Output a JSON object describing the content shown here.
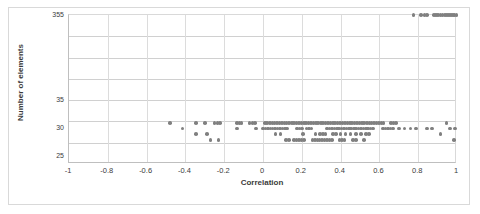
{
  "chart_data": {
    "type": "scatter",
    "title": "",
    "xlabel": "Correlation",
    "ylabel": "Number of elements",
    "xlim": [
      -1,
      1
    ],
    "xticks": [
      -1,
      -0.8,
      -0.6,
      -0.4,
      -0.2,
      0,
      0.2,
      0.4,
      0.6,
      0.8,
      1
    ],
    "xticklabels": [
      "-1",
      "-0.8",
      "-0.6",
      "-0.4",
      "-0.2",
      "0",
      "0.2",
      "0.4",
      "0.6",
      "0.8",
      "1"
    ],
    "yticklabels": [
      "355",
      "35",
      "30",
      "25"
    ],
    "ytick_positions_frac": [
      0.0,
      0.571,
      0.762,
      0.952
    ],
    "grid": true,
    "grid_rows": 7,
    "marker_color": "#808080",
    "marker_shape": "circle",
    "axis_note": "y-axis is irregular/broken: 25, 30, 35 then jumps to 355",
    "series": [
      {
        "name": "elements",
        "points": [
          [
            0.775,
            355
          ],
          [
            0.815,
            355
          ],
          [
            0.833,
            355
          ],
          [
            0.846,
            355
          ],
          [
            0.88,
            355
          ],
          [
            0.892,
            355
          ],
          [
            0.903,
            355
          ],
          [
            0.915,
            355
          ],
          [
            0.926,
            355
          ],
          [
            0.937,
            355
          ],
          [
            0.948,
            355
          ],
          [
            0.958,
            355
          ],
          [
            0.968,
            355
          ],
          [
            0.978,
            355
          ],
          [
            0.988,
            355
          ],
          [
            0.997,
            355
          ],
          [
            -0.48,
            31
          ],
          [
            -0.345,
            31
          ],
          [
            -0.3,
            31
          ],
          [
            -0.25,
            31
          ],
          [
            -0.235,
            31
          ],
          [
            -0.222,
            31
          ],
          [
            -0.135,
            31
          ],
          [
            -0.122,
            31
          ],
          [
            -0.11,
            31
          ],
          [
            -0.07,
            31
          ],
          [
            -0.055,
            31
          ],
          [
            -0.042,
            31
          ],
          [
            0.01,
            31
          ],
          [
            0.022,
            31
          ],
          [
            0.035,
            31
          ],
          [
            0.048,
            31
          ],
          [
            0.06,
            31
          ],
          [
            0.072,
            31
          ],
          [
            0.085,
            31
          ],
          [
            0.098,
            31
          ],
          [
            0.11,
            31
          ],
          [
            0.122,
            31
          ],
          [
            0.135,
            31
          ],
          [
            0.148,
            31
          ],
          [
            0.16,
            31
          ],
          [
            0.172,
            31
          ],
          [
            0.185,
            31
          ],
          [
            0.198,
            31
          ],
          [
            0.21,
            31
          ],
          [
            0.222,
            31
          ],
          [
            0.235,
            31
          ],
          [
            0.248,
            31
          ],
          [
            0.26,
            31
          ],
          [
            0.272,
            31
          ],
          [
            0.285,
            31
          ],
          [
            0.298,
            31
          ],
          [
            0.31,
            31
          ],
          [
            0.322,
            31
          ],
          [
            0.335,
            31
          ],
          [
            0.348,
            31
          ],
          [
            0.36,
            31
          ],
          [
            0.372,
            31
          ],
          [
            0.385,
            31
          ],
          [
            0.398,
            31
          ],
          [
            0.41,
            31
          ],
          [
            0.422,
            31
          ],
          [
            0.435,
            31
          ],
          [
            0.448,
            31
          ],
          [
            0.46,
            31
          ],
          [
            0.472,
            31
          ],
          [
            0.485,
            31
          ],
          [
            0.498,
            31
          ],
          [
            0.51,
            31
          ],
          [
            0.522,
            31
          ],
          [
            0.535,
            31
          ],
          [
            0.548,
            31
          ],
          [
            0.56,
            31
          ],
          [
            0.572,
            31
          ],
          [
            0.585,
            31
          ],
          [
            0.598,
            31
          ],
          [
            0.61,
            31
          ],
          [
            0.622,
            31
          ],
          [
            0.66,
            31
          ],
          [
            0.672,
            31
          ],
          [
            0.685,
            31
          ],
          [
            0.945,
            31
          ],
          [
            -0.415,
            30
          ],
          [
            -0.135,
            30
          ],
          [
            -0.035,
            30
          ],
          [
            0.0,
            30
          ],
          [
            0.012,
            30
          ],
          [
            0.025,
            30
          ],
          [
            0.038,
            30
          ],
          [
            0.05,
            30
          ],
          [
            0.062,
            30
          ],
          [
            0.075,
            30
          ],
          [
            0.088,
            30
          ],
          [
            0.1,
            30
          ],
          [
            0.112,
            30
          ],
          [
            0.125,
            30
          ],
          [
            0.175,
            30
          ],
          [
            0.188,
            30
          ],
          [
            0.2,
            30
          ],
          [
            0.225,
            30
          ],
          [
            0.238,
            30
          ],
          [
            0.25,
            30
          ],
          [
            0.33,
            30
          ],
          [
            0.342,
            30
          ],
          [
            0.355,
            30
          ],
          [
            0.368,
            30
          ],
          [
            0.38,
            30
          ],
          [
            0.392,
            30
          ],
          [
            0.405,
            30
          ],
          [
            0.418,
            30
          ],
          [
            0.43,
            30
          ],
          [
            0.442,
            30
          ],
          [
            0.455,
            30
          ],
          [
            0.468,
            30
          ],
          [
            0.48,
            30
          ],
          [
            0.492,
            30
          ],
          [
            0.505,
            30
          ],
          [
            0.518,
            30
          ],
          [
            0.53,
            30
          ],
          [
            0.542,
            30
          ],
          [
            0.555,
            30
          ],
          [
            0.568,
            30
          ],
          [
            0.62,
            30
          ],
          [
            0.632,
            30
          ],
          [
            0.645,
            30
          ],
          [
            0.658,
            30
          ],
          [
            0.67,
            30
          ],
          [
            0.7,
            30
          ],
          [
            0.73,
            30
          ],
          [
            0.76,
            30
          ],
          [
            0.79,
            30
          ],
          [
            0.845,
            30
          ],
          [
            0.87,
            30
          ],
          [
            0.965,
            30
          ],
          [
            0.99,
            30
          ],
          [
            -0.345,
            29
          ],
          [
            -0.29,
            29
          ],
          [
            0.065,
            29
          ],
          [
            0.09,
            29
          ],
          [
            0.205,
            29
          ],
          [
            0.27,
            29
          ],
          [
            0.295,
            29
          ],
          [
            0.31,
            29
          ],
          [
            0.322,
            29
          ],
          [
            0.36,
            29
          ],
          [
            0.375,
            29
          ],
          [
            0.4,
            29
          ],
          [
            0.425,
            29
          ],
          [
            0.45,
            29
          ],
          [
            0.48,
            29
          ],
          [
            0.505,
            29
          ],
          [
            0.53,
            29
          ],
          [
            0.545,
            29
          ],
          [
            0.915,
            29
          ],
          [
            -0.27,
            28
          ],
          [
            -0.23,
            28
          ],
          [
            0.12,
            28
          ],
          [
            0.135,
            28
          ],
          [
            0.16,
            28
          ],
          [
            0.172,
            28
          ],
          [
            0.185,
            28
          ],
          [
            0.198,
            28
          ],
          [
            0.21,
            28
          ],
          [
            0.255,
            28
          ],
          [
            0.268,
            28
          ],
          [
            0.28,
            28
          ],
          [
            0.292,
            28
          ],
          [
            0.305,
            28
          ],
          [
            0.318,
            28
          ],
          [
            0.33,
            28
          ],
          [
            0.342,
            28
          ],
          [
            0.355,
            28
          ],
          [
            0.395,
            28
          ],
          [
            0.408,
            28
          ],
          [
            0.42,
            28
          ],
          [
            0.465,
            28
          ],
          [
            0.478,
            28
          ],
          [
            0.52,
            28
          ],
          [
            0.985,
            28
          ]
        ]
      }
    ]
  }
}
